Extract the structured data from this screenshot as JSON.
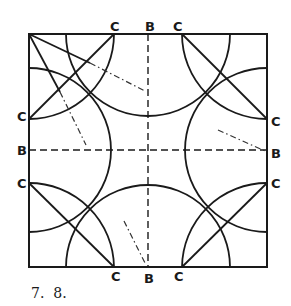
{
  "figure": {
    "caption": "7.  8.",
    "labels": {
      "top": [
        "C",
        "B",
        "C"
      ],
      "bottom": [
        "C",
        "B",
        "C"
      ],
      "left": [
        "C",
        "B",
        "C"
      ],
      "right": [
        "C",
        "B",
        "C"
      ]
    },
    "colors": {
      "ink": "#1a1a1a",
      "background": "#ffffff"
    }
  }
}
